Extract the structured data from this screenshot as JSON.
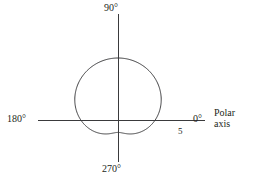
{
  "figure": {
    "kind": "polar-plot",
    "background_color": "#ffffff",
    "line_color": "#3a3a3c",
    "text_color": "#231f20"
  },
  "labels": {
    "angle_90": "90°",
    "angle_180": "180°",
    "angle_0": "0°",
    "angle_270": "270°",
    "radial_tick": "5",
    "polar_axis_line1": "Polar",
    "polar_axis_line2": "axis"
  },
  "chart_data": {
    "type": "line",
    "coordinate_system": "polar",
    "title": "",
    "xlabel": "",
    "ylabel": "",
    "grid": false,
    "legend": null,
    "angle_unit": "degrees",
    "angle_tick_labels": [
      "0°",
      "90°",
      "180°",
      "270°"
    ],
    "angle_ticks": [
      0,
      90,
      180,
      270
    ],
    "radial_tick_labels": [
      "5"
    ],
    "radial_ticks": [
      5
    ],
    "rlim": [
      0,
      5
    ],
    "curve_name": "dimpled limacon",
    "curve_equation": "r = 3 + 2 sin(theta)",
    "annotations": [
      {
        "text": "Polar axis",
        "at_angle": 0,
        "placement": "right-of-axis"
      },
      {
        "text": "5",
        "at_angle": 0,
        "at_radius": 5,
        "placement": "below-axis"
      }
    ],
    "series": [
      {
        "name": "r = 3 + 2 sin(theta)",
        "theta": [
          0,
          10,
          20,
          30,
          40,
          50,
          60,
          70,
          80,
          90,
          100,
          110,
          120,
          130,
          140,
          150,
          160,
          170,
          180,
          190,
          200,
          210,
          220,
          230,
          240,
          250,
          260,
          270,
          280,
          290,
          300,
          310,
          320,
          330,
          340,
          350,
          360
        ],
        "r": [
          5.0,
          5.0,
          4.96,
          4.87,
          4.73,
          4.56,
          4.37,
          4.17,
          3.97,
          3.79,
          3.63,
          3.49,
          3.37,
          3.29,
          3.23,
          3.2,
          3.2,
          3.23,
          3.29,
          3.37,
          3.49,
          3.63,
          3.79,
          3.97,
          4.17,
          4.37,
          4.56,
          4.73,
          4.87,
          4.96,
          5.0,
          5.0,
          4.96,
          4.87,
          4.73,
          4.56,
          5.0
        ]
      }
    ]
  },
  "geometry": {
    "origin_x": 118,
    "origin_y": 120,
    "pixels_per_unit": 12.4,
    "horizontal_axis_x1": 38,
    "horizontal_axis_x2": 205,
    "vertical_axis_y1": 14,
    "vertical_axis_y2": 162
  }
}
